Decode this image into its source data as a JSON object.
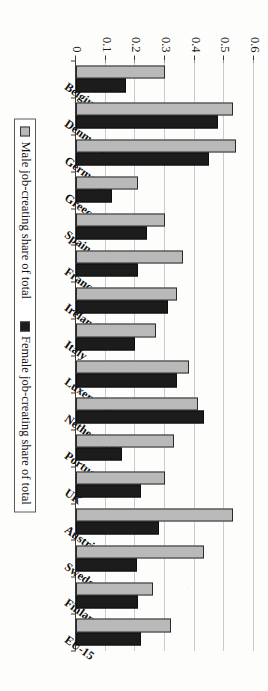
{
  "chart_data": {
    "type": "bar",
    "title": "",
    "xlabel": "",
    "ylabel": "Percentage job-creating self-employed",
    "ylim": [
      0,
      0.6
    ],
    "yticks": [
      0,
      0.1,
      0.2,
      0.3,
      0.4,
      0.5,
      0.6
    ],
    "ytick_labels": [
      "0",
      "0.1",
      "0.2",
      "0.3",
      "0.4",
      "0.5",
      "0.6"
    ],
    "grid": true,
    "legend_position": "bottom",
    "orientation": "rotated-90",
    "categories": [
      "Belgium",
      "Denmark",
      "Germany",
      "Greece",
      "Spain",
      "France",
      "Ireland",
      "Italy",
      "Luxembourg",
      "Netherlands",
      "Portugal",
      "UK",
      "Austria",
      "Sweden",
      "Finland",
      "EU-15"
    ],
    "series": [
      {
        "name": "Male job-creating share of total",
        "color": "#b9b9b9",
        "values": [
          0.3,
          0.53,
          0.54,
          0.21,
          0.3,
          0.36,
          0.34,
          0.27,
          0.38,
          0.41,
          0.33,
          0.3,
          0.53,
          0.43,
          0.26,
          0.32
        ]
      },
      {
        "name": "Female job-creating share of total",
        "color": "#1c1c1c",
        "values": [
          0.17,
          0.48,
          0.45,
          0.12,
          0.24,
          0.21,
          0.31,
          0.2,
          0.34,
          0.43,
          0.155,
          0.22,
          0.28,
          0.205,
          0.21,
          0.22
        ]
      }
    ]
  },
  "legend": {
    "items": [
      {
        "label": "Male job-creating share of total",
        "swatch": "male"
      },
      {
        "label": "Female job-creating share of total",
        "swatch": "female"
      }
    ]
  },
  "axis": {
    "y_title": "Percentage job-creating\nself-employed"
  }
}
